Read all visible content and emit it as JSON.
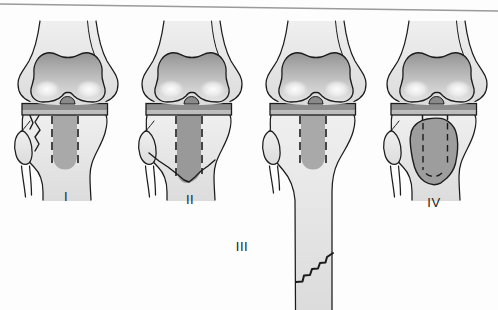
{
  "diagram": {
    "figures": [
      {
        "label": "I"
      },
      {
        "label": "II"
      },
      {
        "label": "III"
      },
      {
        "label": "IV"
      }
    ]
  },
  "colors": {
    "background": "#fdfdfd",
    "ink": "#1c1c1c",
    "bone_light": "#efefef",
    "bone_shade": "#dcdcdc",
    "condyle_top": "#949494",
    "condyle_mid": "#c2c2c2",
    "condyle_bottom": "#e4e4e4",
    "tray_dark": "#8d8d8d",
    "tray_light": "#bdbdbd",
    "stem": "#a9a9a9",
    "stem_dark": "#999999",
    "fragment": "#9d9d9d",
    "notch": "#8a8a8a",
    "rule": "#9a9a9a"
  }
}
